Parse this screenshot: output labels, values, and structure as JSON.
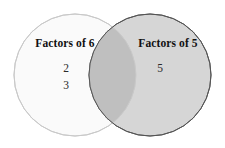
{
  "diagram": {
    "type": "venn-diagram",
    "background_color": "#ffffff",
    "sets": [
      {
        "id": "left",
        "label": "Factors of 6",
        "fill_color": "#fafafa",
        "stroke_color": "#c9c9c9",
        "center_x": 75,
        "center_y": 75,
        "radius": 61,
        "members": [
          "2",
          "3"
        ]
      },
      {
        "id": "right",
        "label": "Factors of 5",
        "fill_color": "#d5d5d5",
        "stroke_color": "#555555",
        "center_x": 150,
        "center_y": 75,
        "radius": 61,
        "members": [
          "5"
        ]
      }
    ],
    "intersection": {
      "label": "",
      "fill_color": "#bfbfbf",
      "members": []
    }
  }
}
